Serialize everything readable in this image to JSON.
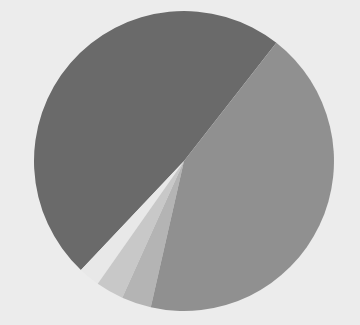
{
  "page": {
    "background_color": "#ececec",
    "width": 360,
    "height": 325
  },
  "chart_data": {
    "type": "pie",
    "title": "",
    "subtitle": "",
    "xlabel": "",
    "ylabel": "",
    "grid": false,
    "legend_position": "none",
    "annotations": [],
    "center": {
      "x": 184,
      "y": 161
    },
    "radius": 150,
    "start_angle_deg": 52,
    "direction": "counterclockwise",
    "categories": [
      "Segment 1",
      "Segment 2",
      "Segment 3",
      "Segment 4",
      "Segment 5"
    ],
    "values": [
      48.5,
      2.3,
      3.0,
      3.2,
      43.0
    ],
    "colors": [
      "#6a6a6a",
      "#e8e8e8",
      "#c8c8c8",
      "#b4b4b4",
      "#909090"
    ],
    "slices": [
      {
        "label": "Segment 1",
        "value": 48.5,
        "color": "#6a6a6a",
        "start_deg": 52,
        "end_deg": 226.6
      },
      {
        "label": "Segment 2",
        "value": 2.3,
        "color": "#e8e8e8",
        "start_deg": 226.6,
        "end_deg": 234.9
      },
      {
        "label": "Segment 3",
        "value": 3.0,
        "color": "#c8c8c8",
        "start_deg": 234.9,
        "end_deg": 245.7
      },
      {
        "label": "Segment 4",
        "value": 3.2,
        "color": "#b4b4b4",
        "start_deg": 245.7,
        "end_deg": 257.2
      },
      {
        "label": "Segment 5",
        "value": 43.0,
        "color": "#909090",
        "start_deg": 257.2,
        "end_deg": 412
      }
    ]
  }
}
